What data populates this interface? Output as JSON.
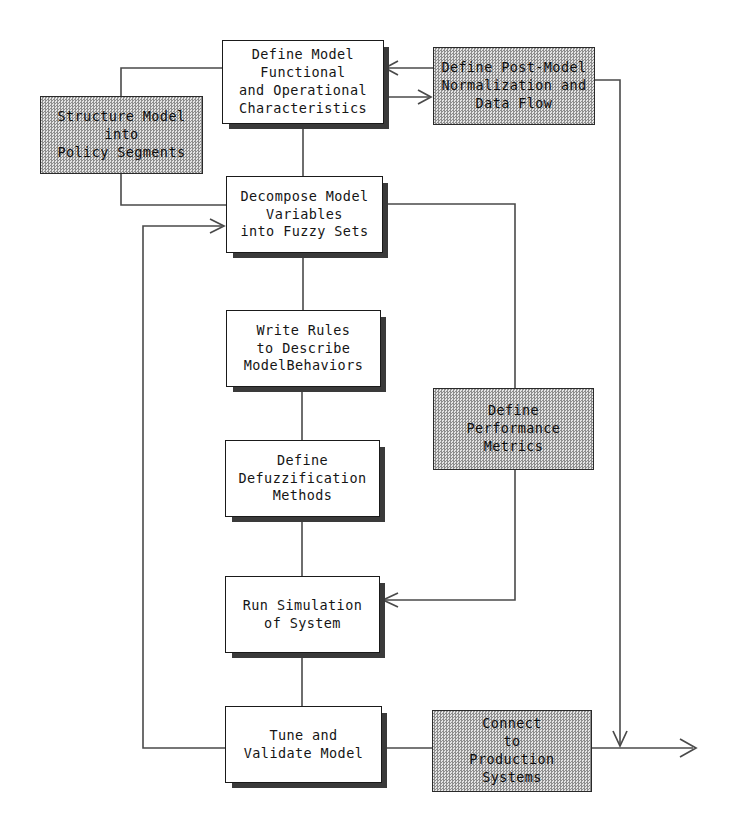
{
  "diagram": {
    "canvas": {
      "width": 734,
      "height": 839
    },
    "style": {
      "plain_fill": "#ffffff",
      "shaded_fill": "#c9c9c9",
      "line_color": "#4a4a4a",
      "border_color": "#1a1a1a",
      "shadow_color": "#3a3a3a",
      "text_color": "#151515"
    },
    "nodes": [
      {
        "id": "define_model",
        "label": "Define Model\nFunctional\nand Operational\nCharacteristics",
        "kind": "plain",
        "x": 222,
        "y": 40,
        "w": 162,
        "h": 84
      },
      {
        "id": "post_model",
        "label": "Define Post-Model\nNormalization and\nData Flow",
        "kind": "shaded",
        "x": 433,
        "y": 47,
        "w": 162,
        "h": 78
      },
      {
        "id": "structure_model",
        "label": "Structure Model\ninto\nPolicy Segments",
        "kind": "shaded",
        "x": 40,
        "y": 96,
        "w": 163,
        "h": 78
      },
      {
        "id": "decompose_model",
        "label": "Decompose Model\nVariables\ninto Fuzzy Sets",
        "kind": "plain",
        "x": 226,
        "y": 176,
        "w": 157,
        "h": 77
      },
      {
        "id": "write_rules",
        "label": "Write Rules\nto Describe\nModelBehaviors",
        "kind": "plain",
        "x": 226,
        "y": 310,
        "w": 155,
        "h": 77
      },
      {
        "id": "performance_metrics",
        "label": "Define\nPerformance\nMetrics",
        "kind": "shaded",
        "x": 433,
        "y": 388,
        "w": 161,
        "h": 82
      },
      {
        "id": "defuzzification",
        "label": "Define\nDefuzzification\nMethods",
        "kind": "plain",
        "x": 225,
        "y": 440,
        "w": 155,
        "h": 77
      },
      {
        "id": "run_simulation",
        "label": "Run Simulation\nof System",
        "kind": "plain",
        "x": 225,
        "y": 576,
        "w": 155,
        "h": 77
      },
      {
        "id": "tune_validate",
        "label": "Tune and\nValidate Model",
        "kind": "plain",
        "x": 225,
        "y": 706,
        "w": 157,
        "h": 77
      },
      {
        "id": "connect_production",
        "label": "Connect\nto\nProduction\nSystems",
        "kind": "shaded",
        "x": 432,
        "y": 710,
        "w": 160,
        "h": 82
      }
    ],
    "edges": [
      {
        "id": "post-to-define",
        "from": "post_model",
        "to": "define_model",
        "arrow": "left"
      },
      {
        "id": "define-to-post",
        "from": "define_model",
        "to": "post_model",
        "arrow": "right"
      },
      {
        "id": "define-to-structure",
        "from": "define_model",
        "to": "structure_model",
        "arrow": "none"
      },
      {
        "id": "structure-to-decompose",
        "from": "structure_model",
        "to": "decompose_model",
        "arrow": "none"
      },
      {
        "id": "define-to-decompose",
        "from": "define_model",
        "to": "decompose_model",
        "arrow": "none"
      },
      {
        "id": "decompose-to-write",
        "from": "decompose_model",
        "to": "write_rules",
        "arrow": "none"
      },
      {
        "id": "write-to-defuzz",
        "from": "write_rules",
        "to": "defuzzification",
        "arrow": "none"
      },
      {
        "id": "defuzz-to-run",
        "from": "defuzzification",
        "to": "run_simulation",
        "arrow": "none"
      },
      {
        "id": "run-to-tune",
        "from": "run_simulation",
        "to": "tune_validate",
        "arrow": "none"
      },
      {
        "id": "decompose-to-metrics",
        "from": "decompose_model",
        "to": "performance_metrics",
        "arrow": "none"
      },
      {
        "id": "metrics-to-run",
        "from": "performance_metrics",
        "to": "run_simulation",
        "arrow": "left"
      },
      {
        "id": "tune-feedback-decompose",
        "from": "tune_validate",
        "to": "decompose_model",
        "arrow": "right"
      },
      {
        "id": "tune-to-connect",
        "from": "tune_validate",
        "to": "connect_production",
        "arrow": "none"
      },
      {
        "id": "post-model-down-to-output",
        "from": "post_model",
        "to": "output",
        "arrow": "down"
      },
      {
        "id": "connect-to-output",
        "from": "connect_production",
        "to": "output",
        "arrow": "right"
      }
    ]
  }
}
